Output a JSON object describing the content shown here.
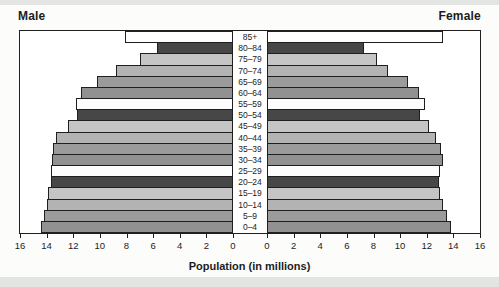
{
  "figure": {
    "male_label": "Male",
    "female_label": "Female",
    "axis_title": "Population (in millions)"
  },
  "colors": {
    "outline": "#1f1f1f",
    "text": "#1c1c1c",
    "band": "#e2e5e1",
    "page_bg": "#fcfcfb",
    "plot_bg": "#ffffff"
  },
  "chart_data": {
    "type": "bar",
    "subtype": "population_pyramid",
    "title": "",
    "xlabel": "Population (in millions)",
    "unit": "millions",
    "xlim": [
      0,
      16
    ],
    "tick_step": 2,
    "male_ticks": [
      16,
      14,
      12,
      10,
      8,
      6,
      4,
      2,
      0
    ],
    "female_ticks": [
      0,
      2,
      4,
      6,
      8,
      10,
      12,
      14,
      16
    ],
    "categories_top_to_bottom": [
      "85+",
      "80–84",
      "75–79",
      "70–74",
      "65–69",
      "60–64",
      "55–59",
      "50–54",
      "45–49",
      "40–44",
      "35–39",
      "30–34",
      "25–29",
      "20–24",
      "15–19",
      "10–14",
      "5–9",
      "0–4"
    ],
    "series": [
      {
        "name": "Male",
        "side": "left",
        "values": [
          8.1,
          5.7,
          7.0,
          8.8,
          10.2,
          11.4,
          11.8,
          11.7,
          12.4,
          13.3,
          13.5,
          13.6,
          13.7,
          13.7,
          13.9,
          14.0,
          14.2,
          14.4
        ]
      },
      {
        "name": "Female",
        "side": "right",
        "values": [
          13.2,
          7.3,
          8.3,
          9.1,
          10.6,
          11.4,
          11.9,
          11.5,
          12.2,
          12.7,
          13.1,
          13.2,
          13.0,
          12.9,
          13.0,
          13.2,
          13.5,
          13.8
        ]
      }
    ],
    "bar_fill_colors_top_to_bottom": [
      "#fdfdfd",
      "#474747",
      "#c5c5c5",
      "#b3b3b3",
      "#9b9b9b",
      "#919191",
      "#fdfdfd",
      "#474747",
      "#c5c5c5",
      "#b3b3b3",
      "#9b9b9b",
      "#919191",
      "#fdfdfd",
      "#474747",
      "#c5c5c5",
      "#b3b3b3",
      "#9b9b9b",
      "#919191"
    ],
    "legend": "none",
    "grid": false
  }
}
